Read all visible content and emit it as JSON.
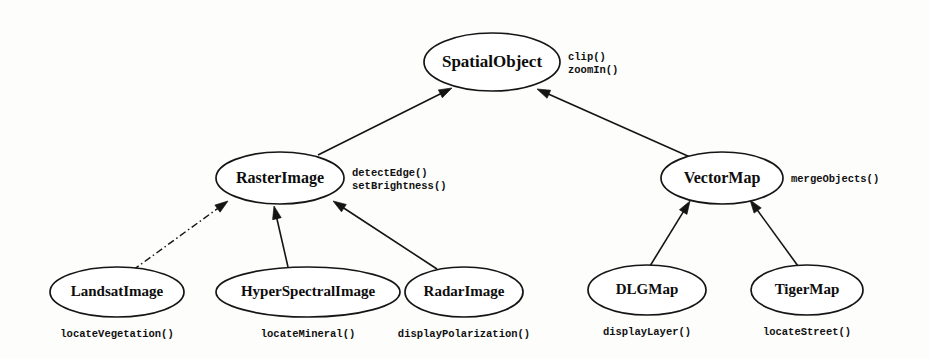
{
  "diagram": {
    "type": "class-inheritance-hierarchy",
    "nodes": [
      {
        "id": "spatial-object",
        "label": "SpatialObject",
        "cx": 492,
        "cy": 62,
        "rx": 68,
        "ry": 29,
        "font_size": 17,
        "methods": [
          "clip()",
          "zoomIn()"
        ],
        "methods_position": "right"
      },
      {
        "id": "raster-image",
        "label": "RasterImage",
        "cx": 280,
        "cy": 178,
        "rx": 64,
        "ry": 26,
        "font_size": 16,
        "methods": [
          "detectEdge()",
          "setBrightness()"
        ],
        "methods_position": "right"
      },
      {
        "id": "vector-map",
        "label": "VectorMap",
        "cx": 722,
        "cy": 178,
        "rx": 61,
        "ry": 26,
        "font_size": 16,
        "methods": [
          "mergeObjects()"
        ],
        "methods_position": "right"
      },
      {
        "id": "landsat-image",
        "label": "LandsatImage",
        "cx": 117,
        "cy": 292,
        "rx": 67,
        "ry": 25,
        "font_size": 15,
        "methods": [
          "locateVegetation()"
        ],
        "methods_position": "below"
      },
      {
        "id": "hyper-spectral-image",
        "label": "HyperSpectralImage",
        "cx": 308,
        "cy": 292,
        "rx": 92,
        "ry": 25,
        "font_size": 15,
        "methods": [
          "locateMineral()"
        ],
        "methods_position": "below"
      },
      {
        "id": "radar-image",
        "label": "RadarImage",
        "cx": 464,
        "cy": 292,
        "rx": 59,
        "ry": 25,
        "font_size": 15,
        "methods": [
          "displayPolarization()"
        ],
        "methods_position": "below"
      },
      {
        "id": "dlg-map",
        "label": "DLGMap",
        "cx": 647,
        "cy": 290,
        "rx": 59,
        "ry": 25,
        "font_size": 15,
        "methods": [
          "displayLayer()"
        ],
        "methods_position": "below"
      },
      {
        "id": "tiger-map",
        "label": "TigerMap",
        "cx": 807,
        "cy": 290,
        "rx": 56,
        "ry": 25,
        "font_size": 15,
        "methods": [
          "locateStreet()"
        ],
        "methods_position": "below"
      }
    ],
    "edges": [
      {
        "id": "raster-to-spatial",
        "from": "raster-image",
        "to": "spatial-object",
        "style": "solid",
        "x1": 318,
        "y1": 155,
        "x2": 452,
        "y2": 88
      },
      {
        "id": "vector-to-spatial",
        "from": "vector-map",
        "to": "spatial-object",
        "style": "solid",
        "x1": 690,
        "y1": 157,
        "x2": 537,
        "y2": 89
      },
      {
        "id": "landsat-to-raster",
        "from": "landsat-image",
        "to": "raster-image",
        "style": "dashed",
        "x1": 133,
        "y1": 270,
        "x2": 228,
        "y2": 201
      },
      {
        "id": "hyperspectral-to-raster",
        "from": "hyper-spectral-image",
        "to": "raster-image",
        "style": "solid",
        "x1": 288,
        "y1": 267,
        "x2": 274,
        "y2": 206
      },
      {
        "id": "radar-to-raster",
        "from": "radar-image",
        "to": "raster-image",
        "style": "solid",
        "x1": 437,
        "y1": 269,
        "x2": 333,
        "y2": 201
      },
      {
        "id": "dlg-to-vector",
        "from": "dlg-map",
        "to": "vector-map",
        "style": "solid",
        "x1": 650,
        "y1": 266,
        "x2": 690,
        "y2": 201
      },
      {
        "id": "tiger-to-vector",
        "from": "tiger-map",
        "to": "vector-map",
        "style": "solid",
        "x1": 798,
        "y1": 266,
        "x2": 750,
        "y2": 200
      }
    ]
  }
}
